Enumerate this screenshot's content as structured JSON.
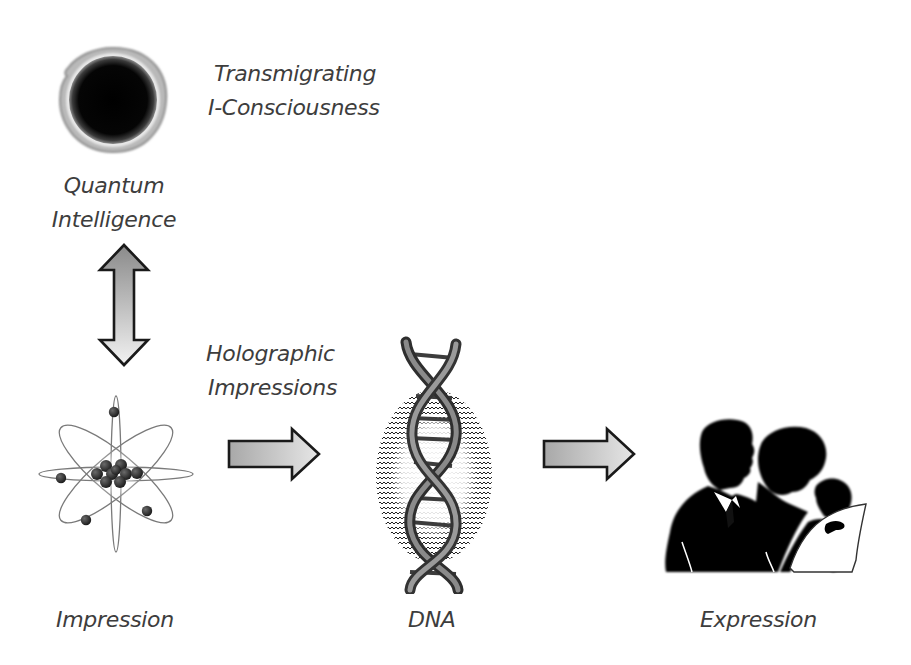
{
  "diagram": {
    "nodes": {
      "quantum_intelligence": {
        "label_line1": "Quantum",
        "label_line2": "Intelligence",
        "icon": "black-hole-sphere-icon"
      },
      "transmigrating": {
        "label_line1": "Transmigrating",
        "label_line2": "I-Consciousness"
      },
      "impression": {
        "label": "Impression",
        "icon": "atom-icon"
      },
      "holographic": {
        "label_line1": "Holographic",
        "label_line2": "Impressions"
      },
      "dna": {
        "label": "DNA",
        "icon": "dna-helix-icon"
      },
      "expression": {
        "label": "Expression",
        "icon": "family-silhouette-icon"
      }
    },
    "edges": [
      {
        "from": "Quantum Intelligence",
        "to": "Impression",
        "type": "bidirectional"
      },
      {
        "from": "Impression",
        "to": "DNA",
        "type": "directed",
        "label": "Holographic Impressions"
      },
      {
        "from": "DNA",
        "to": "Expression",
        "type": "directed"
      }
    ],
    "colors": {
      "text": "#3d3d3d",
      "arrow_fill_dark": "#8a8a8a",
      "arrow_fill_light": "#ececec",
      "arrow_stroke": "#1a1a1a",
      "silhouette": "#000000",
      "background": "#ffffff"
    }
  }
}
